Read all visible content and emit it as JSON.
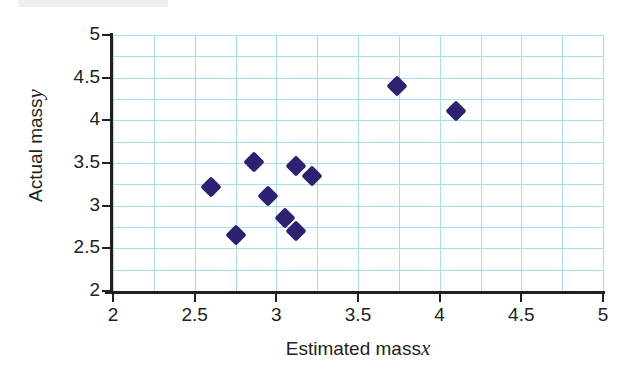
{
  "chart_data": {
    "type": "scatter",
    "title": "",
    "xlabel": "Estimated mass x",
    "xlabel_text": "Estimated mass",
    "xlabel_var": "x",
    "ylabel": "Actual mass y",
    "ylabel_text": "Actual mass",
    "ylabel_var": "y",
    "xlim": [
      2,
      5
    ],
    "ylim": [
      2,
      5
    ],
    "x_ticks": [
      "2",
      "2.5",
      "3",
      "3.5",
      "4",
      "4.5",
      "5"
    ],
    "x_tick_values": [
      2,
      2.5,
      3,
      3.5,
      4,
      4.5,
      5
    ],
    "y_ticks": [
      "2",
      "2.5",
      "3",
      "3.5",
      "4",
      "4.5",
      "5"
    ],
    "y_tick_values": [
      2,
      2.5,
      3,
      3.5,
      4,
      4.5,
      5
    ],
    "grid": true,
    "grid_step": 0.25,
    "grid_color": "#aadcf0",
    "marker_color": "#2d2170",
    "marker_shape": "diamond",
    "legend": null,
    "points": [
      {
        "x": 2.6,
        "y": 3.22
      },
      {
        "x": 2.75,
        "y": 2.66
      },
      {
        "x": 2.86,
        "y": 3.51
      },
      {
        "x": 2.95,
        "y": 3.11
      },
      {
        "x": 3.05,
        "y": 2.86
      },
      {
        "x": 3.12,
        "y": 2.7
      },
      {
        "x": 3.12,
        "y": 3.46
      },
      {
        "x": 3.22,
        "y": 3.35
      },
      {
        "x": 3.74,
        "y": 4.4
      },
      {
        "x": 4.1,
        "y": 4.11
      }
    ]
  }
}
